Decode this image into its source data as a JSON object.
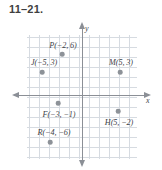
{
  "exercise": {
    "number": "11–21."
  },
  "graph": {
    "axis_labels": {
      "x": "x",
      "y": "y"
    },
    "colors": {
      "grid": "#c9cfd8",
      "axis": "#8b8f96",
      "point": "#8d9298",
      "text": "#3d4247",
      "heading": "#3f3f3f"
    },
    "grid_columns": 11,
    "grid_rows": 13,
    "points": [
      {
        "name": "P",
        "label": "P(−2, 6)",
        "x": -2,
        "y": 6,
        "dot_left_px": 62,
        "dot_top_px": 30,
        "label_left_px": 63,
        "label_top_px": 21
      },
      {
        "name": "J",
        "label": "J(−5, 3)",
        "x": -5,
        "y": 3,
        "dot_left_px": 42,
        "dot_top_px": 48,
        "label_left_px": 44,
        "label_top_px": 38
      },
      {
        "name": "M",
        "label": "M(5, 3)",
        "x": 5,
        "y": 3,
        "dot_left_px": 120,
        "dot_top_px": 48,
        "label_left_px": 121,
        "label_top_px": 38
      },
      {
        "name": "F",
        "label": "F(−3, −1)",
        "x": -3,
        "y": -1,
        "dot_left_px": 58,
        "dot_top_px": 79,
        "label_left_px": 59,
        "label_top_px": 90
      },
      {
        "name": "H",
        "label": "H(5, −2)",
        "x": 5,
        "y": -2,
        "dot_left_px": 118,
        "dot_top_px": 87,
        "label_left_px": 119,
        "label_top_px": 98
      },
      {
        "name": "R",
        "label": "R(−4, −6)",
        "x": -4,
        "y": -6,
        "dot_left_px": 50,
        "dot_top_px": 118,
        "label_left_px": 54,
        "label_top_px": 108
      }
    ]
  }
}
